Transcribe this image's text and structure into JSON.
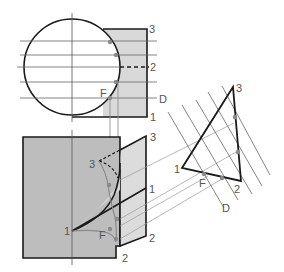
{
  "figure": {
    "colors": {
      "outline": "#1a1a1a",
      "construction": "#888888",
      "fill_light": "#d9d9d9",
      "fill_dark": "#bdbdbd",
      "curve_point": "#8a8a8a",
      "label": "#555555"
    },
    "top_view": {
      "labels": {
        "p3": "3",
        "p2": "2",
        "pD": "D",
        "p1": "1",
        "pF": "F"
      }
    },
    "front_view": {
      "labels": {
        "p3_left": "3",
        "p3_right": "3",
        "p1_left": "1",
        "p1_right": "1",
        "pF": "F",
        "p2_right": "2",
        "p2_bottom": "2"
      }
    },
    "aux_view": {
      "labels": {
        "p3": "3",
        "p1": "1",
        "p2": "2",
        "pF": "F",
        "pD": "D"
      }
    }
  }
}
